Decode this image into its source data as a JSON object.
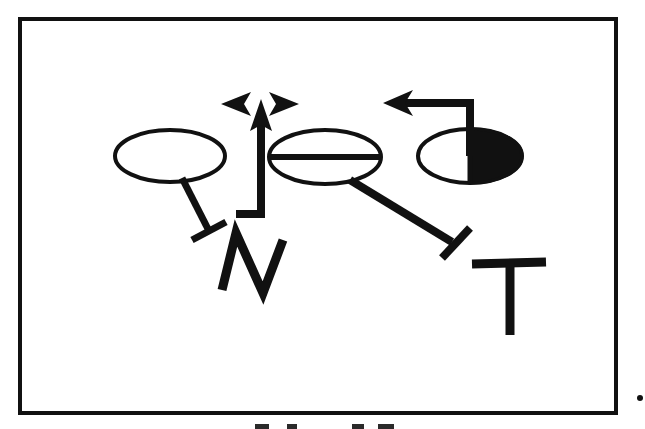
{
  "figure": {
    "title": "",
    "caption_partial": "",
    "background_color": "#ffffff",
    "ink_color": "#111111",
    "frame": {
      "name": "outer-border",
      "x": 18,
      "y": 17,
      "width": 600,
      "height": 398,
      "stroke_width": 4,
      "fill": "#ffffff",
      "stroke": "#111111"
    },
    "stray_mark": {
      "name": "stray-dot",
      "x": 640,
      "y": 398,
      "radius": 3
    }
  },
  "nodes": [
    {
      "id": "node-left-ellipse",
      "name": "left-ellipse-node",
      "shape": "ellipse",
      "fill_style": "hollow",
      "cx": 170,
      "cy": 156,
      "rx": 55,
      "ry": 26,
      "stroke_width": 4,
      "fill": "#ffffff",
      "stroke": "#111111",
      "internal_line": "none"
    },
    {
      "id": "node-middle-ellipse",
      "name": "middle-ellipse-node",
      "shape": "ellipse",
      "fill_style": "hollow-with-horizontal-bar",
      "cx": 325,
      "cy": 157,
      "rx": 56,
      "ry": 27,
      "stroke_width": 4,
      "fill": "#ffffff",
      "stroke": "#111111",
      "internal_line": "horizontal-diameter"
    },
    {
      "id": "node-right-ellipse",
      "name": "right-half-filled-ellipse-node",
      "shape": "ellipse",
      "fill_style": "right-half-filled",
      "cx": 470,
      "cy": 156,
      "rx": 52,
      "ry": 27,
      "stroke_width": 4,
      "fill": "#ffffff",
      "filled_half_color": "#111111",
      "stroke": "#111111",
      "internal_line": "vertical-radius-up"
    }
  ],
  "letters": [
    {
      "id": "letter-n",
      "name": "letter-n-glyph",
      "text": "N",
      "x": 262,
      "y": 285,
      "font_size": 92,
      "color": "#111111",
      "style": "hand-drawn-zigzag"
    },
    {
      "id": "letter-t",
      "name": "letter-t-glyph",
      "text": "T",
      "x": 495,
      "y": 290,
      "font_size": 88,
      "color": "#111111",
      "style": "hand-drawn-serifless"
    }
  ],
  "edges": [
    {
      "id": "edge-left-inhibition",
      "name": "inhibition-edge-left-ellipse-to-n",
      "type": "inhibition",
      "head": "t-bar",
      "from": "node-left-ellipse",
      "to": "letter-n",
      "x1": 183,
      "y1": 180,
      "x2": 208,
      "y2": 230,
      "stroke_width": 7,
      "bar_length": 34,
      "color": "#111111"
    },
    {
      "id": "edge-middle-inhibition",
      "name": "inhibition-edge-middle-ellipse-to-t",
      "type": "inhibition",
      "head": "t-bar",
      "from": "node-middle-ellipse",
      "to": "letter-t",
      "x1": 351,
      "y1": 182,
      "x2": 452,
      "y2": 243,
      "stroke_width": 8,
      "bar_length": 36,
      "color": "#111111"
    },
    {
      "id": "edge-up-activation",
      "name": "activation-edge-elbow-up-arrow",
      "type": "activation",
      "head": "open-arrowhead-up",
      "path": "M 237 214 L 261 214 L 261 112",
      "stroke_width": 8,
      "color": "#111111"
    },
    {
      "id": "edge-arrowhead-left",
      "name": "activation-arrowhead-pointing-left",
      "type": "arrowhead-only",
      "direction": "left",
      "tip_x": 222,
      "tip_y": 104,
      "length": 28,
      "half_height": 13,
      "color": "#111111"
    },
    {
      "id": "edge-arrowhead-right",
      "name": "activation-arrowhead-pointing-right",
      "type": "arrowhead-only",
      "direction": "right",
      "tip_x": 297,
      "tip_y": 104,
      "length": 28,
      "half_height": 13,
      "color": "#111111"
    },
    {
      "id": "edge-right-feedback",
      "name": "activation-edge-right-ellipse-feedback-left-arrow",
      "type": "activation",
      "head": "open-arrowhead-left",
      "path": "M 470 156 L 470 103 L 397 103",
      "tip_x": 384,
      "tip_y": 103,
      "stroke_width": 8,
      "color": "#111111"
    }
  ],
  "legend": {
    "activation_symbol": "arrow",
    "inhibition_symbol": "t-bar"
  }
}
